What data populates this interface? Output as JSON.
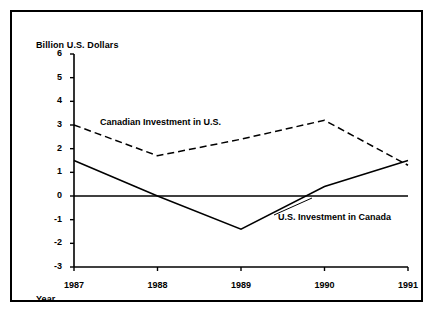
{
  "chart_data": {
    "type": "line",
    "title": "",
    "subtitle": "",
    "xlabel": "Year",
    "ylabel": "Billion U.S. Dollars",
    "x": [
      1987,
      1988,
      1989,
      1990,
      1991
    ],
    "categories": [
      "1987",
      "1988",
      "1989",
      "1990",
      "1991"
    ],
    "xlim": [
      1987,
      1991
    ],
    "ylim": [
      -3,
      6
    ],
    "yticks": [
      6,
      5,
      4,
      3,
      2,
      1,
      0,
      -1,
      -2,
      -3
    ],
    "ytick_labels": [
      "6",
      "5",
      "4",
      "3",
      "2",
      "1",
      "0",
      "-1",
      "-2",
      "-3"
    ],
    "xtick_labels": [
      "1987",
      "1988",
      "1989",
      "1990",
      "1991"
    ],
    "grid": false,
    "legend_position": "inline-annotations",
    "zero_line": true,
    "series": [
      {
        "name": "Canadian Investment in U.S.",
        "style": "dashed",
        "color": "#000000",
        "values": [
          3.0,
          1.7,
          2.4,
          3.2,
          1.3
        ]
      },
      {
        "name": "U.S. Investment in Canada",
        "style": "solid",
        "color": "#000000",
        "values": [
          1.5,
          0.0,
          -1.4,
          0.4,
          1.5
        ]
      }
    ],
    "annotations": [
      {
        "text": "Canadian Investment in U.S.",
        "series": "Canadian Investment in U.S."
      },
      {
        "text": "U.S. Investment in Canada",
        "series": "U.S. Investment in Canada"
      }
    ]
  },
  "axis": {
    "y_title": "Billion U.S. Dollars",
    "x_title": "Year"
  }
}
